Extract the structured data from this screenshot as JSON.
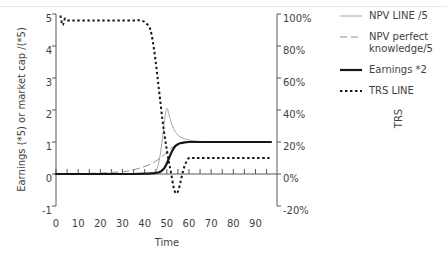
{
  "chart_data": {
    "type": "line",
    "title": "",
    "xlabel": "Time",
    "ylabel": "Earnings (*5) or market cap /(*5)",
    "ylabel_right": "TRS",
    "xlim": [
      0,
      97
    ],
    "ylim": [
      -1,
      5
    ],
    "ylim_right": [
      -20,
      100
    ],
    "grid": false,
    "legend_position": "right",
    "xticks": [
      "0",
      "10",
      "20",
      "30",
      "40",
      "50",
      "60",
      "70",
      "80",
      "90"
    ],
    "xtick_values": [
      0,
      10,
      20,
      30,
      40,
      50,
      60,
      70,
      80,
      90
    ],
    "yticks_left": [
      "5",
      "4",
      "3",
      "2",
      "1",
      "0",
      "-1"
    ],
    "ytick_values_left": [
      5,
      4,
      3,
      2,
      1,
      0,
      -1
    ],
    "yticks_right": [
      "100%",
      "80%",
      "60%",
      "40%",
      "20%",
      "0%",
      "-20%"
    ],
    "ytick_values_right": [
      100,
      80,
      60,
      40,
      20,
      0,
      -20
    ],
    "series": [
      {
        "name": "NPV LINE /5",
        "axis": "left",
        "color": "#a6a6a6",
        "style": "solid",
        "width": 1,
        "x": [
          0,
          5,
          10,
          15,
          20,
          25,
          30,
          35,
          40,
          42,
          44,
          45,
          46,
          47,
          48,
          49,
          50,
          51,
          52,
          53,
          54,
          55,
          56,
          58,
          60,
          62,
          65,
          70,
          75,
          80,
          85,
          90,
          95,
          97
        ],
        "y": [
          0,
          0,
          0,
          0,
          0,
          0,
          0,
          0,
          0,
          0.02,
          0.05,
          0.1,
          0.25,
          0.6,
          1.1,
          1.7,
          2.05,
          1.85,
          1.6,
          1.42,
          1.3,
          1.22,
          1.16,
          1.1,
          1.06,
          1.04,
          1.02,
          1.0,
          1.0,
          1.0,
          1.0,
          1.0,
          1.0,
          1.0
        ]
      },
      {
        "name": "NPV perfect knowledge/5",
        "axis": "left",
        "color": "#8c8c8c",
        "style": "dashed",
        "width": 1,
        "x": [
          0,
          5,
          10,
          15,
          20,
          25,
          30,
          33,
          35,
          37,
          39,
          41,
          43,
          45,
          47,
          49,
          51,
          53,
          55,
          57,
          60,
          65,
          70,
          75,
          80,
          85,
          90,
          95,
          97
        ],
        "y": [
          0,
          0,
          0.01,
          0.02,
          0.03,
          0.05,
          0.07,
          0.1,
          0.13,
          0.17,
          0.21,
          0.26,
          0.32,
          0.4,
          0.5,
          0.62,
          0.75,
          0.86,
          0.93,
          0.97,
          1.0,
          1.0,
          1.0,
          1.0,
          1.0,
          1.0,
          1.0,
          1.0,
          1.0
        ]
      },
      {
        "name": "Earnings *2",
        "axis": "left",
        "color": "#161616",
        "style": "solid",
        "width": 2.2,
        "x": [
          0,
          10,
          20,
          30,
          35,
          40,
          43,
          45,
          47,
          48,
          49,
          50,
          51,
          52,
          53,
          54,
          55,
          56,
          58,
          60,
          65,
          70,
          75,
          80,
          85,
          90,
          95,
          97
        ],
        "y": [
          0,
          0,
          0,
          0,
          0,
          0.01,
          0.02,
          0.03,
          0.07,
          0.12,
          0.2,
          0.33,
          0.5,
          0.66,
          0.79,
          0.88,
          0.93,
          0.96,
          0.99,
          1.0,
          1.0,
          1.0,
          1.0,
          1.0,
          1.0,
          1.0,
          1.0,
          1.0
        ]
      },
      {
        "name": "TRS LINE",
        "axis": "right",
        "color": "#161616",
        "style": "dotted",
        "width": 2,
        "x": [
          2,
          3,
          4,
          5,
          8,
          12,
          16,
          20,
          25,
          30,
          35,
          38,
          40,
          42,
          43,
          44,
          45,
          46,
          47,
          48,
          49,
          50,
          51,
          52,
          53,
          54,
          55,
          56,
          57,
          58,
          59,
          60,
          62,
          65,
          70,
          75,
          80,
          85,
          90,
          95,
          97
        ],
        "y_right": [
          99,
          93,
          97,
          96,
          96,
          96,
          96,
          96,
          96,
          96,
          96,
          96,
          95,
          92,
          88,
          80,
          70,
          58,
          46,
          34,
          24,
          15,
          7,
          0,
          -8,
          -12,
          -11,
          -6,
          0,
          5,
          8,
          10,
          10,
          10,
          10,
          10,
          10,
          10,
          10,
          10,
          10
        ]
      }
    ]
  },
  "legend": {
    "items": [
      {
        "label": "NPV LINE /5",
        "icon": "line-solid-thin-icon"
      },
      {
        "label": "NPV perfect knowledge/5",
        "icon": "line-dashed-icon"
      },
      {
        "label": "Earnings *2",
        "icon": "line-solid-thick-icon"
      },
      {
        "label": "TRS LINE",
        "icon": "line-dotted-icon"
      }
    ]
  },
  "colors": {
    "npv_line": "#a6a6a6",
    "npv_perfect": "#8c8c8c",
    "earnings": "#161616",
    "trs": "#161616",
    "axis": "#595959",
    "text": "#3f3f3f"
  }
}
